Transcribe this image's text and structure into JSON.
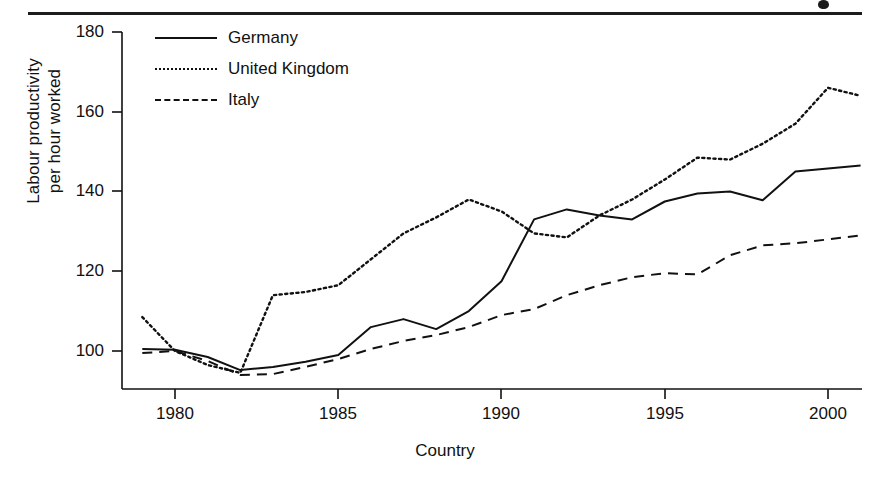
{
  "figure": {
    "top_rule": "horizontal-rule",
    "scan_artifact": "page-edge-mark"
  },
  "legend": {
    "position": "top-left-inside",
    "entries": [
      {
        "label": "Germany",
        "style": "solid",
        "swatch": "line-swatch-solid"
      },
      {
        "label": "United Kingdom",
        "style": "dotted",
        "swatch": "line-swatch-dotted"
      },
      {
        "label": "Italy",
        "style": "dashed",
        "swatch": "line-swatch-dashed"
      }
    ]
  },
  "axes": {
    "ylabel_line1": "Labour productivity",
    "ylabel_line2": "per hour worked",
    "xlabel": "Country",
    "yticks": [
      "180",
      "160",
      "140",
      "120",
      "100"
    ],
    "xticks": [
      "1980",
      "1985",
      "1990",
      "1995",
      "2000"
    ]
  },
  "chart_data": {
    "type": "line",
    "title": "",
    "xlabel": "Country",
    "ylabel": "Labour productivity per hour worked",
    "xlim": [
      1978.4,
      2001.0
    ],
    "ylim": [
      88,
      186
    ],
    "xticks": [
      1980,
      1985,
      1990,
      1995,
      2000
    ],
    "yticks": [
      100,
      120,
      140,
      160,
      180
    ],
    "grid": false,
    "legend_position": "upper left",
    "x": [
      1979,
      1980,
      1981,
      1982,
      1983,
      1984,
      1985,
      1986,
      1987,
      1988,
      1989,
      1990,
      1991,
      1992,
      1993,
      1994,
      1995,
      1996,
      1997,
      1998,
      1999,
      2000,
      2001
    ],
    "series": [
      {
        "name": "Germany",
        "style": "solid",
        "color": "#111111",
        "values": [
          100.5,
          100.3,
          98.5,
          95.2,
          96.0,
          97.3,
          99.0,
          106.0,
          108.0,
          105.5,
          110.0,
          117.5,
          133.0,
          135.5,
          134.0,
          133.0,
          137.5,
          139.5,
          140.0,
          137.8,
          145.0,
          145.8,
          146.5
        ]
      },
      {
        "name": "United Kingdom",
        "style": "dotted",
        "color": "#111111",
        "values": [
          108.5,
          100.0,
          96.5,
          94.5,
          114.0,
          114.8,
          116.5,
          123.0,
          129.5,
          133.5,
          138.0,
          135.0,
          129.5,
          128.5,
          134.0,
          138.0,
          143.0,
          148.5,
          148.0,
          152.0,
          157.0,
          166.0,
          164.0
        ]
      },
      {
        "name": "Italy",
        "style": "dashed",
        "color": "#111111",
        "values": [
          99.5,
          100.0,
          97.5,
          94.0,
          94.2,
          96.0,
          98.0,
          100.5,
          102.5,
          104.0,
          106.0,
          109.0,
          110.5,
          114.0,
          116.5,
          118.5,
          119.5,
          119.2,
          124.0,
          126.5,
          127.0,
          128.0,
          129.0
        ]
      }
    ]
  }
}
